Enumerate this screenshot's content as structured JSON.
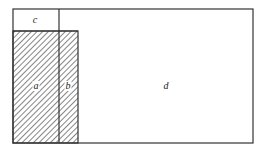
{
  "diagram": {
    "type": "area-partition",
    "regions": [
      {
        "id": "a",
        "label": "a",
        "hatched": true
      },
      {
        "id": "b",
        "label": "b",
        "hatched": true
      },
      {
        "id": "c",
        "label": "c",
        "hatched": false
      },
      {
        "id": "d",
        "label": "d",
        "hatched": false
      }
    ],
    "colors": {
      "stroke": "#333333",
      "hatch": "#333333",
      "background": "#ffffff"
    }
  }
}
